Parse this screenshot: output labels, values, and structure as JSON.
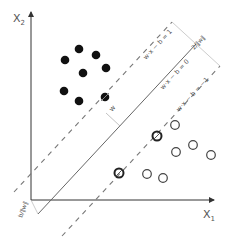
{
  "diagram": {
    "axes": {
      "x_label": "X",
      "x_sub": "1",
      "y_label": "X",
      "y_sub": "2"
    },
    "lines": {
      "upper_margin": "w·x − b = 1",
      "hyperplane": "w·x − b = 0",
      "lower_margin": "w·x − b = −1"
    },
    "annotations": {
      "margin_width": "2/‖w‖",
      "offset": "b/‖w‖",
      "normal_vector": "w"
    },
    "colors": {
      "axis": "#333333",
      "line": "#555555",
      "dash": "#777777",
      "filled_point": "#111111",
      "open_point": "#444444"
    },
    "class_positive": [
      [
        79,
        49
      ],
      [
        96,
        55
      ],
      [
        65,
        60
      ],
      [
        83,
        73
      ],
      [
        106,
        68
      ],
      [
        64,
        91
      ],
      [
        79,
        101
      ]
    ],
    "class_positive_support": [
      [
        105,
        97
      ]
    ],
    "class_negative": [
      [
        175,
        125
      ],
      [
        176,
        152
      ],
      [
        193,
        145
      ],
      [
        211,
        155
      ],
      [
        147,
        174
      ],
      [
        163,
        178
      ]
    ],
    "class_negative_support": [
      [
        157,
        136
      ],
      [
        119,
        173
      ]
    ]
  }
}
